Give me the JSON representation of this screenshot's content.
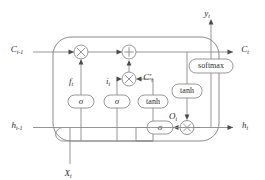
{
  "diagram": {
    "type": "lstm-cell-diagram",
    "colors": {
      "background": "#ffffff",
      "wire": "#8a8a8a",
      "border": "#8a8a8a",
      "text": "#2b2b2b",
      "arrowhead": "#4a4a4a"
    },
    "signals": {
      "cell_state_in": "C",
      "cell_state_in_sub": "t-1",
      "cell_state_out": "C",
      "cell_state_out_sub": "t",
      "hidden_in": "h",
      "hidden_in_sub": "t-1",
      "hidden_out": "h",
      "hidden_out_sub": "t",
      "input": "X",
      "input_sub": "t",
      "output": "y",
      "output_sub": "t",
      "forget_gate": "f",
      "forget_gate_sub": "t",
      "input_gate": "i",
      "input_gate_sub": "t",
      "candidate": "C′",
      "candidate_sub": "t",
      "output_gate": "O",
      "output_gate_sub": "t"
    },
    "operators": {
      "multiply_forget": "×",
      "add": "+",
      "multiply_input": "×",
      "multiply_output": "×"
    },
    "activation_boxes": [
      {
        "id": "sigma-forget",
        "label": "σ"
      },
      {
        "id": "sigma-input",
        "label": "σ"
      },
      {
        "id": "tanh-candidate",
        "label": "tanh"
      },
      {
        "id": "sigma-output",
        "label": "σ"
      },
      {
        "id": "tanh-cell",
        "label": "tanh"
      },
      {
        "id": "softmax-output",
        "label": "softmax"
      }
    ]
  }
}
